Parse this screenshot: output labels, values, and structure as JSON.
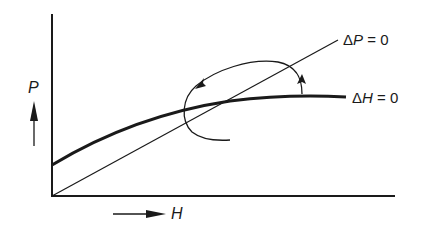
{
  "diagram": {
    "type": "phase-diagram",
    "axes": {
      "x_label": "H",
      "y_label": "P"
    },
    "curves": [
      {
        "id": "dH0",
        "label_prefix": "Δ",
        "label_var": "H",
        "label_rest": " = 0",
        "style": "thick"
      },
      {
        "id": "dP0",
        "label_prefix": "Δ",
        "label_var": "P",
        "label_rest": " = 0",
        "style": "thin"
      }
    ],
    "annotation": "counterclockwise spiral trajectory around intersection",
    "colors": {
      "ink": "#1a1a1a",
      "background": "#ffffff"
    }
  }
}
